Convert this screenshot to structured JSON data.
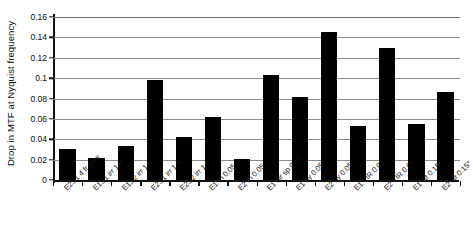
{
  "chart_data": {
    "type": "bar",
    "title": "",
    "xlabel": "",
    "ylabel": "Drop in MTF at Nyquist frequency",
    "ylim": [
      0,
      0.16
    ],
    "ytick_labels": [
      "0.16",
      "0.14",
      "0.12",
      "0.1",
      "0.08",
      "0.06",
      "0.04",
      "0.02",
      "0"
    ],
    "ytick_values": [
      0.16,
      0.14,
      0.12,
      0.1,
      0.08,
      0.06,
      0.04,
      0.02,
      0
    ],
    "grid": true,
    "legend": "none",
    "bar_color": "#000000",
    "grid_color": "#8a8a8a",
    "categories": [
      "E2S1 4 fr pow",
      "E1S1 irr 1 fr",
      "E1S2 irr 1 fr",
      "E2S1 irr 1 fr",
      "E2S2 irr 1 fr",
      "E1 th 0.05",
      "E2 th 0.05",
      "E1 air sp 0.05",
      "E1 dy 0.05",
      "E2 dy 0.05",
      "E1 TIR 0.05",
      "E2 TIR 0.05",
      "E1 tilt 0.15°",
      "E2 tilt 0.15°"
    ],
    "values": [
      0.03,
      0.022,
      0.033,
      0.098,
      0.042,
      0.062,
      0.021,
      0.103,
      0.081,
      0.145,
      0.053,
      0.13,
      0.055,
      0.086
    ]
  }
}
